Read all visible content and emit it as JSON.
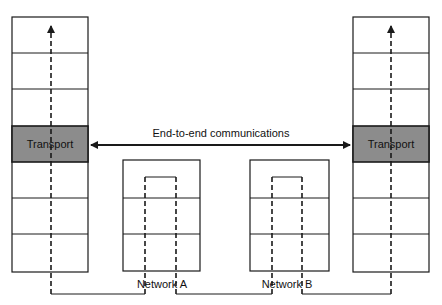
{
  "diagram": {
    "colors": {
      "stroke": "#1a1a1a",
      "transport_fill": "#8c8c8c",
      "background": "#ffffff"
    },
    "left_stack": {
      "label": "Transport",
      "layers": 7,
      "highlighted_layer": 4
    },
    "right_stack": {
      "label": "Transport",
      "layers": 7,
      "highlighted_layer": 4
    },
    "end_to_end_label": "End-to-end communications",
    "networks": [
      {
        "label": "Network A",
        "layers": 3
      },
      {
        "label": "Network B",
        "layers": 3
      }
    ]
  }
}
